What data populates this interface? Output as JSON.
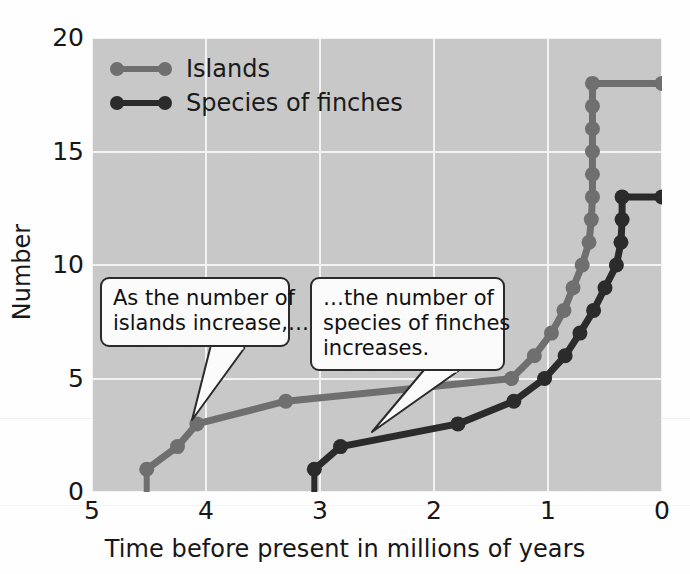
{
  "chart_data": {
    "type": "line",
    "title": "",
    "xlabel": "Time before present in millions of years",
    "ylabel": "Number",
    "xlim": [
      5,
      0
    ],
    "ylim": [
      0,
      20
    ],
    "x_ticks": [
      5,
      4,
      3,
      2,
      1,
      0
    ],
    "y_ticks": [
      0,
      5,
      10,
      15,
      20
    ],
    "x_axis_reversed": true,
    "grid": true,
    "legend_position": "top-left",
    "background_color": "#c9c9c9",
    "gridline_color": "#f3f3f3",
    "series": [
      {
        "name": "Islands",
        "color": "#6f6f6f",
        "points": [
          {
            "x": 4.52,
            "y": 1
          },
          {
            "x": 4.25,
            "y": 2
          },
          {
            "x": 4.08,
            "y": 3
          },
          {
            "x": 3.3,
            "y": 4
          },
          {
            "x": 1.32,
            "y": 5
          },
          {
            "x": 1.12,
            "y": 6
          },
          {
            "x": 0.97,
            "y": 7
          },
          {
            "x": 0.86,
            "y": 8
          },
          {
            "x": 0.78,
            "y": 9
          },
          {
            "x": 0.7,
            "y": 10
          },
          {
            "x": 0.64,
            "y": 11
          },
          {
            "x": 0.62,
            "y": 12
          },
          {
            "x": 0.61,
            "y": 13
          },
          {
            "x": 0.61,
            "y": 14
          },
          {
            "x": 0.61,
            "y": 15
          },
          {
            "x": 0.61,
            "y": 16
          },
          {
            "x": 0.61,
            "y": 17
          },
          {
            "x": 0.61,
            "y": 18
          },
          {
            "x": 0.0,
            "y": 18
          }
        ]
      },
      {
        "name": "Species of finches",
        "color": "#2b2b2b",
        "points": [
          {
            "x": 3.05,
            "y": 1
          },
          {
            "x": 2.82,
            "y": 2
          },
          {
            "x": 1.79,
            "y": 3
          },
          {
            "x": 1.3,
            "y": 4
          },
          {
            "x": 1.03,
            "y": 5
          },
          {
            "x": 0.85,
            "y": 6
          },
          {
            "x": 0.72,
            "y": 7
          },
          {
            "x": 0.6,
            "y": 8
          },
          {
            "x": 0.5,
            "y": 9
          },
          {
            "x": 0.4,
            "y": 10
          },
          {
            "x": 0.36,
            "y": 11
          },
          {
            "x": 0.35,
            "y": 12
          },
          {
            "x": 0.35,
            "y": 13
          },
          {
            "x": 0.0,
            "y": 13
          }
        ]
      }
    ],
    "annotations": [
      {
        "id": "islands-callout",
        "lines": [
          "As the number of",
          "islands increase,…"
        ],
        "box": {
          "left": 100,
          "top": 277,
          "width": 190,
          "height": 74
        },
        "pointer": {
          "x": 192,
          "y": 420
        }
      },
      {
        "id": "finches-callout",
        "lines": [
          "…the number of",
          "species of finches",
          "increases."
        ],
        "box": {
          "left": 310,
          "top": 277,
          "width": 195,
          "height": 97
        },
        "pointer": {
          "x": 372,
          "y": 432
        }
      }
    ]
  },
  "legend": {
    "items": [
      {
        "label": "Islands",
        "color": "#6f6f6f"
      },
      {
        "label": "Species of finches",
        "color": "#2b2b2b"
      }
    ]
  },
  "axes": {
    "y_title": "Number",
    "x_title": "Time before present in millions of years",
    "y_tick_labels": [
      "20",
      "15",
      "10",
      "5",
      "0"
    ],
    "x_tick_labels": [
      "5",
      "4",
      "3",
      "2",
      "1",
      "0"
    ]
  }
}
